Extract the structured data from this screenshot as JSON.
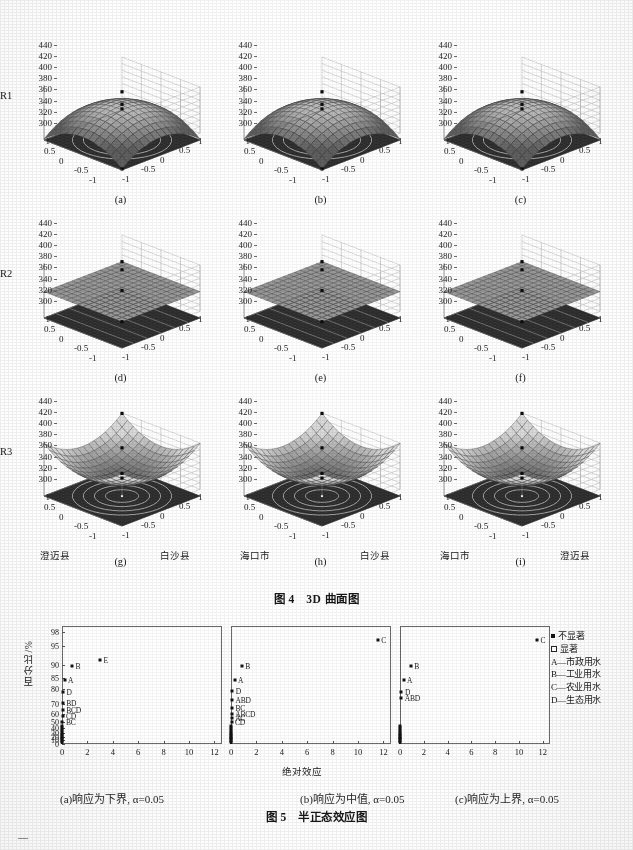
{
  "figure4": {
    "title": "图 4　3D 曲面图",
    "zlabels": [
      "R1",
      "R2",
      "R3"
    ],
    "z_ticks": [
      "440",
      "420",
      "400",
      "380",
      "360",
      "340",
      "320",
      "300"
    ],
    "x_ticks_left": [
      "1",
      "0.5",
      "0",
      "-0.5",
      "-1"
    ],
    "x_ticks_right": [
      "-1",
      "-0.5",
      "0",
      "0.5",
      "1"
    ],
    "panels": [
      {
        "letter": "(a)",
        "row": "R1",
        "shape": "dome",
        "xaxis": "",
        "yaxis": ""
      },
      {
        "letter": "(b)",
        "row": "R1",
        "shape": "dome",
        "xaxis": "",
        "yaxis": ""
      },
      {
        "letter": "(c)",
        "row": "R1",
        "shape": "dome",
        "xaxis": "",
        "yaxis": ""
      },
      {
        "letter": "(d)",
        "row": "R2",
        "shape": "plane",
        "xaxis": "",
        "yaxis": ""
      },
      {
        "letter": "(e)",
        "row": "R2",
        "shape": "plane",
        "xaxis": "",
        "yaxis": ""
      },
      {
        "letter": "(f)",
        "row": "R2",
        "shape": "plane",
        "xaxis": "",
        "yaxis": ""
      },
      {
        "letter": "(g)",
        "row": "R3",
        "shape": "bowl",
        "xaxis": "澄迈县",
        "yaxis": "白沙县"
      },
      {
        "letter": "(h)",
        "row": "R3",
        "shape": "bowl",
        "xaxis": "海口市",
        "yaxis": "白沙县"
      },
      {
        "letter": "(i)",
        "row": "R3",
        "shape": "bowl",
        "xaxis": "海口市",
        "yaxis": "澄迈县"
      }
    ]
  },
  "figure5": {
    "title": "图 5　半正态效应图",
    "ylabel": "百分比/%",
    "xlabel": "绝对效应",
    "captions": [
      "(a)响应为下界, α=0.05",
      "(b)响应为中值, α=0.05",
      "(c)响应为上界, α=0.05"
    ],
    "legend": {
      "markers": [
        {
          "glyph": "filled-square",
          "label": "不显著"
        },
        {
          "glyph": "open-square",
          "label": "显著"
        }
      ],
      "items": [
        "A—市政用水",
        "B—工业用水",
        "C—农业用水",
        "D—生态用水"
      ]
    },
    "y_ticks": [
      "98",
      "95",
      "90",
      "85",
      "80",
      "70",
      "60",
      "50",
      "40",
      "30",
      "20",
      "10",
      "0"
    ],
    "x_ticks": [
      "0",
      "2",
      "4",
      "6",
      "8",
      "10",
      "12"
    ]
  },
  "chart_data": [
    {
      "type": "scatter",
      "title": "(a)响应为下界, α=0.05",
      "xlabel": "绝对效应",
      "ylabel": "百分比/%",
      "xlim": [
        0,
        12.6
      ],
      "ylim": [
        0,
        99.3
      ],
      "y_ticks": [
        0,
        10,
        20,
        30,
        40,
        50,
        60,
        70,
        80,
        85,
        90,
        95,
        98
      ],
      "x_ticks": [
        0,
        2,
        4,
        6,
        8,
        10,
        12
      ],
      "grid": false,
      "points": [
        {
          "label": "E",
          "x": 3.0,
          "y": 91.2,
          "significant": false
        },
        {
          "label": "B",
          "x": 0.78,
          "y": 89.6,
          "significant": false
        },
        {
          "label": "A",
          "x": 0.2,
          "y": 84.0,
          "significant": false
        },
        {
          "label": "D",
          "x": 0.07,
          "y": 78.0,
          "significant": false
        },
        {
          "label": "BD",
          "x": 0.06,
          "y": 71.0,
          "significant": false
        },
        {
          "label": "BCD",
          "x": 0.05,
          "y": 64.0,
          "significant": false
        },
        {
          "label": "CD",
          "x": 0.04,
          "y": 57.0,
          "significant": false
        },
        {
          "label": "BC",
          "x": 0.03,
          "y": 50.5,
          "significant": false
        }
      ],
      "unlabeled_stack_y": [
        44,
        40,
        36,
        32,
        28,
        24,
        20,
        16,
        12,
        8,
        4
      ]
    },
    {
      "type": "scatter",
      "title": "(b)响应为中值, α=0.05",
      "xlabel": "绝对效应",
      "ylabel": "百分比/%",
      "xlim": [
        0,
        12.6
      ],
      "ylim": [
        0,
        99.3
      ],
      "y_ticks": [
        0,
        10,
        20,
        30,
        40,
        50,
        60,
        70,
        80,
        85,
        90,
        95,
        98
      ],
      "x_ticks": [
        0,
        2,
        4,
        6,
        8,
        10,
        12
      ],
      "grid": false,
      "points": [
        {
          "label": "C",
          "x": 11.55,
          "y": 96.2,
          "significant": false
        },
        {
          "label": "B",
          "x": 0.85,
          "y": 89.8,
          "significant": false
        },
        {
          "label": "A",
          "x": 0.28,
          "y": 84.2,
          "significant": false
        },
        {
          "label": "D",
          "x": 0.1,
          "y": 78.5,
          "significant": false
        },
        {
          "label": "ABD",
          "x": 0.08,
          "y": 72.5,
          "significant": false
        },
        {
          "label": "BC",
          "x": 0.07,
          "y": 66.5,
          "significant": false
        },
        {
          "label": "ABCD",
          "x": 0.06,
          "y": 60.5,
          "significant": false
        },
        {
          "label": "AC",
          "x": 0.05,
          "y": 55.0,
          "significant": false
        },
        {
          "label": "CD",
          "x": 0.04,
          "y": 50.0,
          "significant": false
        }
      ],
      "unlabeled_stack_y": [
        44,
        40,
        36,
        32,
        28,
        24,
        20,
        16,
        12,
        8,
        4
      ]
    },
    {
      "type": "scatter",
      "title": "(c)响应为上界, α=0.05",
      "xlabel": "绝对效应",
      "ylabel": "百分比/%",
      "xlim": [
        0,
        12.6
      ],
      "ylim": [
        0,
        99.3
      ],
      "y_ticks": [
        0,
        10,
        20,
        30,
        40,
        50,
        60,
        70,
        80,
        85,
        90,
        95,
        98
      ],
      "x_ticks": [
        0,
        2,
        4,
        6,
        8,
        10,
        12
      ],
      "grid": false,
      "points": [
        {
          "label": "C",
          "x": 11.5,
          "y": 96.3,
          "significant": false
        },
        {
          "label": "B",
          "x": 0.9,
          "y": 89.8,
          "significant": false
        },
        {
          "label": "A",
          "x": 0.3,
          "y": 84.3,
          "significant": false
        },
        {
          "label": "D",
          "x": 0.12,
          "y": 78.3,
          "significant": false
        },
        {
          "label": "ABD",
          "x": 0.1,
          "y": 74.0,
          "significant": false
        }
      ],
      "unlabeled_stack_y": [
        44,
        40,
        36,
        32,
        28,
        24,
        20,
        16,
        12,
        8,
        4
      ]
    }
  ]
}
